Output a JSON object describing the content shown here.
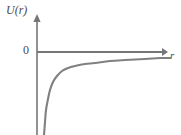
{
  "figure": {
    "name": "potential-energy-curve",
    "background_color": "#ffffff",
    "axis_color": "#767676",
    "curve_color": "#808080",
    "text_color": "#4a4a4a"
  },
  "labels": {
    "y_axis": "U(r)",
    "x_axis": "r",
    "y_tick_zero": "0"
  },
  "chart_data": {
    "type": "line",
    "title": "",
    "xlabel": "r",
    "ylabel": "U(r)",
    "xlim": [
      0,
      181
    ],
    "ylim": [
      -135,
      20
    ],
    "grid": false,
    "legend": null,
    "annotations": [
      {
        "text": "0",
        "x": 30,
        "y": 52,
        "note": "zero level tick label on U(r) axis"
      }
    ],
    "axes": {
      "x_axis_y_pixel": 52,
      "y_axis_x_pixel": 37,
      "x_axis_arrow_tip": [
        168,
        52
      ],
      "y_axis_arrow_tip": [
        37,
        14
      ]
    },
    "series": [
      {
        "name": "U(r)",
        "description": "attractive potential, negative everywhere, asymptotic to zero as r increases",
        "points": [
          [
            44,
            135
          ],
          [
            45,
            122
          ],
          [
            46,
            110
          ],
          [
            48,
            99
          ],
          [
            50,
            90
          ],
          [
            53,
            82
          ],
          [
            57,
            76
          ],
          [
            62,
            71
          ],
          [
            68,
            68
          ],
          [
            75,
            66
          ],
          [
            85,
            64
          ],
          [
            95,
            63
          ],
          [
            110,
            61
          ],
          [
            125,
            60
          ],
          [
            145,
            59
          ],
          [
            160,
            58
          ],
          [
            170,
            58
          ]
        ]
      }
    ]
  }
}
